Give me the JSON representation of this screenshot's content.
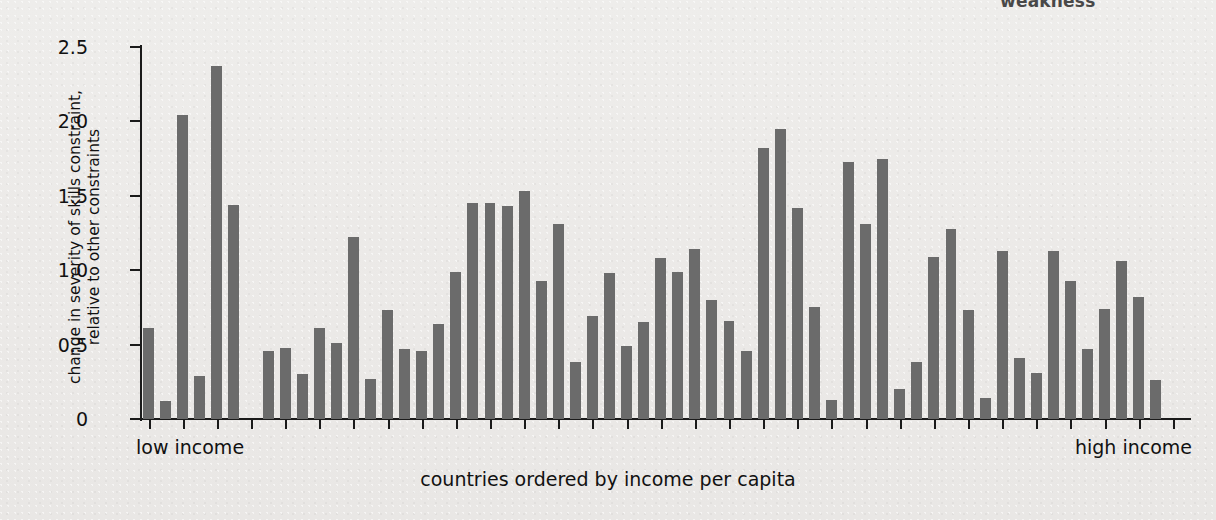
{
  "top_fragment": "weakness",
  "chart_data": {
    "type": "bar",
    "title": "",
    "subtitle": "",
    "xlabel": "countries ordered by income per capita",
    "ylabel": "change in severity of skills constraint,\nrelative to other constraints",
    "ylim": [
      0,
      2.5
    ],
    "yticks": [
      0,
      0.5,
      1.0,
      1.5,
      2.0,
      2.5
    ],
    "ytick_labels": [
      "0",
      "0.5",
      "1.0",
      "1.5",
      "2.0",
      "2.5"
    ],
    "grid": false,
    "legend": null,
    "bar_color": "#6b6b6b",
    "axis_color": "#1a1a1a",
    "background_color": "#ececea",
    "annotations": [
      {
        "name": "low-income",
        "text": "low income",
        "position": "x-axis-left"
      },
      {
        "name": "high-income",
        "text": "high income",
        "position": "x-axis-right"
      }
    ],
    "n_slots": 61,
    "categories": [
      "1",
      "2",
      "3",
      "4",
      "5",
      "6",
      "7",
      "8",
      "9",
      "10",
      "11",
      "12",
      "13",
      "14",
      "15",
      "16",
      "17",
      "18",
      "19",
      "20",
      "21",
      "22",
      "23",
      "24",
      "25",
      "26",
      "27",
      "28",
      "29",
      "30",
      "31",
      "32",
      "33",
      "34",
      "35",
      "36",
      "37",
      "38",
      "39",
      "40",
      "41",
      "42",
      "43",
      "44",
      "45",
      "46",
      "47",
      "48",
      "49",
      "50",
      "51",
      "52",
      "53",
      "54",
      "55",
      "56",
      "57",
      "58",
      "59",
      "60",
      "61"
    ],
    "values": [
      0.61,
      0.12,
      2.04,
      0.29,
      2.37,
      1.44,
      null,
      0.46,
      0.48,
      0.3,
      0.61,
      0.51,
      1.22,
      0.27,
      0.73,
      0.47,
      0.46,
      0.64,
      0.99,
      1.45,
      1.45,
      1.43,
      1.53,
      0.93,
      1.31,
      0.38,
      0.69,
      0.98,
      0.49,
      0.65,
      1.08,
      0.99,
      1.14,
      0.8,
      0.66,
      0.46,
      1.82,
      1.95,
      1.42,
      0.75,
      0.13,
      1.73,
      1.31,
      1.75,
      0.2,
      0.38,
      1.09,
      1.28,
      0.73,
      0.14,
      1.13,
      0.41,
      0.31,
      1.13,
      0.93,
      0.47,
      0.74,
      1.06,
      0.82,
      0.26,
      null
    ]
  }
}
